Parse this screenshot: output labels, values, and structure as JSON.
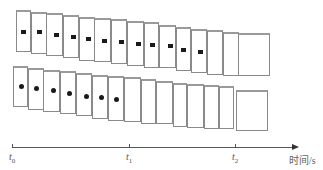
{
  "diagram": {
    "title": "",
    "top_row": {
      "marker": "square",
      "frames_with_marker": 12,
      "cards": [
        {
          "x": 16,
          "y": 10,
          "w": 15,
          "h": 42
        },
        {
          "x": 31,
          "y": 12,
          "w": 16,
          "h": 42
        },
        {
          "x": 46,
          "y": 13,
          "w": 17,
          "h": 43
        },
        {
          "x": 63,
          "y": 15,
          "w": 16,
          "h": 43
        },
        {
          "x": 79,
          "y": 17,
          "w": 16,
          "h": 44
        },
        {
          "x": 94,
          "y": 18,
          "w": 17,
          "h": 44
        },
        {
          "x": 111,
          "y": 19,
          "w": 16,
          "h": 45
        },
        {
          "x": 127,
          "y": 21,
          "w": 17,
          "h": 45
        },
        {
          "x": 144,
          "y": 22,
          "w": 15,
          "h": 46
        },
        {
          "x": 159,
          "y": 25,
          "w": 17,
          "h": 43
        },
        {
          "x": 176,
          "y": 27,
          "w": 15,
          "h": 44
        },
        {
          "x": 191,
          "y": 29,
          "w": 16,
          "h": 44
        },
        {
          "x": 207,
          "y": 30,
          "w": 16,
          "h": 45
        },
        {
          "x": 223,
          "y": 32,
          "w": 16,
          "h": 44
        },
        {
          "x": 238,
          "y": 33,
          "w": 32,
          "h": 43
        }
      ],
      "markers": [
        {
          "x": 21,
          "y": 30
        },
        {
          "x": 37,
          "y": 30
        },
        {
          "x": 54,
          "y": 33
        },
        {
          "x": 71,
          "y": 35
        },
        {
          "x": 86,
          "y": 37
        },
        {
          "x": 102,
          "y": 39
        },
        {
          "x": 119,
          "y": 40
        },
        {
          "x": 136,
          "y": 42
        },
        {
          "x": 150,
          "y": 43
        },
        {
          "x": 168,
          "y": 44
        },
        {
          "x": 181,
          "y": 48
        },
        {
          "x": 198,
          "y": 50
        }
      ]
    },
    "bottom_row": {
      "marker": "dot",
      "frames_with_marker": 7,
      "cards": [
        {
          "x": 13,
          "y": 66,
          "w": 15,
          "h": 41
        },
        {
          "x": 28,
          "y": 68,
          "w": 16,
          "h": 42
        },
        {
          "x": 43,
          "y": 70,
          "w": 17,
          "h": 42
        },
        {
          "x": 60,
          "y": 71,
          "w": 16,
          "h": 43
        },
        {
          "x": 76,
          "y": 73,
          "w": 16,
          "h": 43
        },
        {
          "x": 92,
          "y": 75,
          "w": 16,
          "h": 44
        },
        {
          "x": 108,
          "y": 76,
          "w": 16,
          "h": 45
        },
        {
          "x": 124,
          "y": 77,
          "w": 17,
          "h": 45
        },
        {
          "x": 141,
          "y": 79,
          "w": 15,
          "h": 45
        },
        {
          "x": 156,
          "y": 81,
          "w": 17,
          "h": 43
        },
        {
          "x": 173,
          "y": 83,
          "w": 14,
          "h": 44
        },
        {
          "x": 187,
          "y": 84,
          "w": 17,
          "h": 44
        },
        {
          "x": 204,
          "y": 85,
          "w": 15,
          "h": 44
        },
        {
          "x": 219,
          "y": 86,
          "w": 15,
          "h": 43
        },
        {
          "x": 236,
          "y": 90,
          "w": 32,
          "h": 41
        }
      ],
      "markers": [
        {
          "x": 19,
          "y": 84
        },
        {
          "x": 34,
          "y": 86
        },
        {
          "x": 51,
          "y": 88
        },
        {
          "x": 67,
          "y": 91
        },
        {
          "x": 84,
          "y": 94
        },
        {
          "x": 99,
          "y": 95
        },
        {
          "x": 114,
          "y": 97
        }
      ]
    },
    "axis": {
      "y": 147,
      "x_start": 12,
      "x_end": 292,
      "label": "时间/s",
      "ticks": [
        {
          "x": 12,
          "label": "t",
          "sub": "0"
        },
        {
          "x": 129,
          "label": "t",
          "sub": "1"
        },
        {
          "x": 235,
          "label": "t",
          "sub": "2"
        }
      ]
    },
    "colors": {
      "frame_border": "#8a8a8a",
      "marker": "#1a1a1a",
      "axis": "#555555"
    }
  }
}
